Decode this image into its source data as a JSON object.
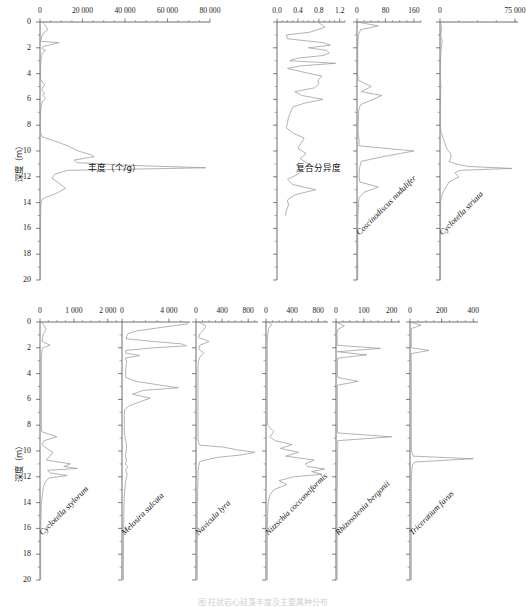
{
  "figure": {
    "width": 526,
    "height": 607,
    "caption": "图  柱状岩心硅藻丰度及主要属种分布",
    "depth_axis": {
      "title": "深度（m）",
      "unit": "m",
      "min": 0,
      "max": 20,
      "ticks": [
        0,
        2,
        4,
        6,
        8,
        10,
        12,
        14,
        16,
        18,
        20
      ],
      "minor_step": 1,
      "direction": "downward"
    },
    "line_color": "#9a9a9a",
    "axis_color": "#4a4a4a",
    "text_color": "#1a1a1a"
  },
  "chart_data": [
    {
      "id": "abundance",
      "row": 1,
      "col": 1,
      "type": "line",
      "title": "丰度（个/g）",
      "title_is_chinese": true,
      "xlabel": "丰度（个/g）",
      "ylabel": "深度（m）",
      "xlim": [
        0,
        80000
      ],
      "xticks": [
        0,
        20000,
        40000,
        60000,
        80000
      ],
      "xtick_labels": [
        "0",
        "20 000",
        "40 000",
        "60 000",
        "80 000"
      ],
      "minor_ticks_per_major": 4,
      "ylim": [
        0,
        20
      ],
      "grid": false,
      "depth": [
        0.0,
        0.3,
        0.6,
        0.9,
        1.2,
        1.5,
        1.6,
        1.75,
        1.9,
        2.05,
        2.2,
        2.4,
        2.6,
        2.8,
        3.0,
        3.3,
        3.6,
        4.0,
        4.4,
        4.7,
        4.9,
        5.1,
        5.3,
        5.5,
        5.7,
        5.9,
        6.1,
        6.4,
        6.7,
        7.0,
        7.4,
        7.8,
        8.2,
        8.6,
        8.9,
        9.2,
        9.6,
        10.0,
        10.3,
        10.45,
        10.7,
        10.9,
        11.1,
        11.3,
        11.5,
        11.65,
        11.8,
        12.1,
        12.5,
        12.9,
        13.3,
        13.6,
        13.8,
        14.2,
        15.0,
        16.0,
        17.0,
        18.0,
        19.0,
        20.0
      ],
      "values": [
        1200,
        2600,
        3700,
        1400,
        700,
        300,
        9000,
        5200,
        1500,
        900,
        2600,
        1100,
        700,
        500,
        420,
        350,
        300,
        260,
        200,
        1200,
        2300,
        1100,
        900,
        2200,
        1400,
        2600,
        1500,
        700,
        420,
        320,
        260,
        220,
        200,
        260,
        900,
        6500,
        13000,
        18000,
        24000,
        25500,
        16000,
        17500,
        40000,
        78000,
        13000,
        10000,
        7000,
        5600,
        9000,
        12000,
        7500,
        2600,
        700,
        420,
        300,
        260,
        220,
        200,
        180,
        160
      ]
    },
    {
      "id": "composite-diversity",
      "row": 1,
      "col": 2,
      "type": "line",
      "title": "复合分异度",
      "title_is_chinese": true,
      "xlabel": "复合分异度",
      "xlim": [
        0,
        1.3
      ],
      "xticks": [
        0.0,
        0.4,
        0.8,
        1.2
      ],
      "xtick_labels": [
        "0.0",
        "0.4",
        "0.8",
        "1.2"
      ],
      "minor_ticks_per_major": 4,
      "ylim": [
        0,
        20
      ],
      "grid": false,
      "depth": [
        0.0,
        0.4,
        0.8,
        1.0,
        1.3,
        1.6,
        1.8,
        2.0,
        2.2,
        2.4,
        2.6,
        2.8,
        3.0,
        3.2,
        3.4,
        3.6,
        3.9,
        4.2,
        4.5,
        4.8,
        5.1,
        5.4,
        5.7,
        6.0,
        6.3,
        6.6,
        7.0,
        7.4,
        7.8,
        8.2,
        8.6,
        9.0,
        9.4,
        9.8,
        10.2,
        10.6,
        11.0,
        11.4,
        11.8,
        12.2,
        12.6,
        13.0,
        13.4,
        13.8,
        14.2,
        14.6,
        15.0
      ],
      "values": [
        0.78,
        0.92,
        0.62,
        0.18,
        0.2,
        0.88,
        1.02,
        0.6,
        0.95,
        1.0,
        0.88,
        0.4,
        0.24,
        1.12,
        0.46,
        0.2,
        0.52,
        0.86,
        0.78,
        0.8,
        0.72,
        0.34,
        0.48,
        0.88,
        0.52,
        0.3,
        0.26,
        0.22,
        0.2,
        0.18,
        0.3,
        0.52,
        0.46,
        0.4,
        0.56,
        0.44,
        0.6,
        0.52,
        0.4,
        0.2,
        0.3,
        0.74,
        0.34,
        0.2,
        0.22,
        0.18,
        0.16
      ]
    },
    {
      "id": "coscinodiscus-nodulifer",
      "row": 1,
      "col": 3,
      "type": "line",
      "title": "Coscinodiscus nodulifer",
      "title_is_chinese": false,
      "xlim": [
        0,
        180
      ],
      "xticks": [
        0,
        80,
        160
      ],
      "xtick_labels": [
        "0",
        "80",
        "160"
      ],
      "minor_ticks_per_major": 4,
      "ylim": [
        0,
        20
      ],
      "grid": false,
      "depth": [
        0.0,
        0.3,
        0.6,
        1.0,
        1.5,
        2.0,
        2.5,
        3.0,
        3.5,
        4.0,
        4.5,
        5.0,
        5.4,
        5.7,
        6.0,
        6.4,
        6.8,
        7.2,
        7.6,
        8.0,
        8.4,
        8.8,
        9.2,
        9.6,
        10.0,
        10.4,
        10.8,
        11.2,
        11.6,
        12.0,
        12.4,
        12.8,
        13.2,
        13.6,
        14.0,
        15.0,
        16.0,
        18.0,
        20.0
      ],
      "values": [
        0,
        60,
        10,
        4,
        3,
        2,
        2,
        2,
        2,
        2,
        3,
        40,
        12,
        70,
        45,
        10,
        5,
        4,
        4,
        3,
        3,
        4,
        6,
        5,
        160,
        80,
        12,
        8,
        6,
        6,
        8,
        60,
        20,
        6,
        4,
        3,
        2,
        2,
        2
      ]
    },
    {
      "id": "cyclotella-striata",
      "row": 1,
      "col": 4,
      "type": "line",
      "title": "Cyclotella striata",
      "title_is_chinese": false,
      "xlim": [
        0,
        78000
      ],
      "xticks": [
        0,
        75000
      ],
      "xtick_labels": [
        "0",
        "75 000"
      ],
      "minor_ticks_per_major": 4,
      "ylim": [
        0,
        20
      ],
      "grid": false,
      "depth": [
        0.0,
        0.5,
        1.0,
        1.5,
        2.0,
        2.5,
        3.0,
        3.5,
        4.0,
        4.5,
        5.0,
        5.5,
        6.0,
        6.5,
        7.0,
        7.5,
        8.0,
        8.5,
        9.0,
        9.4,
        9.8,
        10.2,
        10.5,
        10.8,
        11.0,
        11.2,
        11.35,
        11.5,
        11.7,
        12.0,
        12.4,
        12.8,
        13.2,
        13.6,
        14.0,
        15.0,
        16.0,
        18.0,
        20.0
      ],
      "values": [
        400,
        1800,
        700,
        2200,
        1200,
        800,
        600,
        400,
        300,
        400,
        900,
        600,
        500,
        400,
        300,
        300,
        300,
        900,
        3000,
        5000,
        6500,
        10500,
        11000,
        9000,
        16000,
        28000,
        72000,
        20000,
        15000,
        19000,
        9000,
        6000,
        3000,
        1200,
        700,
        400,
        300,
        200,
        200
      ]
    },
    {
      "id": "cyclotella-stylorum",
      "row": 2,
      "col": 1,
      "type": "line",
      "title": "Cyclotella stylorum",
      "title_is_chinese": false,
      "xlim": [
        0,
        2300
      ],
      "xticks": [
        0,
        1000,
        2000
      ],
      "xtick_labels": [
        "0",
        "1 000",
        "2 000"
      ],
      "minor_ticks_per_major": 4,
      "ylim": [
        0,
        20
      ],
      "grid": false,
      "depth": [
        0.0,
        0.3,
        0.6,
        0.9,
        1.2,
        1.5,
        1.8,
        2.0,
        2.2,
        2.6,
        3.0,
        3.5,
        4.0,
        4.5,
        5.0,
        5.5,
        6.0,
        6.5,
        7.0,
        7.5,
        8.0,
        8.5,
        8.9,
        9.2,
        9.5,
        9.8,
        10.1,
        10.4,
        10.7,
        11.0,
        11.2,
        11.35,
        11.5,
        11.7,
        11.9,
        12.1,
        12.4,
        12.8,
        13.2,
        13.6,
        14.0,
        15.0,
        16.0,
        18.0,
        20.0
      ],
      "values": [
        60,
        130,
        180,
        100,
        80,
        60,
        300,
        80,
        60,
        50,
        40,
        40,
        40,
        40,
        40,
        40,
        40,
        40,
        40,
        40,
        40,
        50,
        500,
        120,
        60,
        200,
        380,
        300,
        180,
        900,
        700,
        1100,
        220,
        300,
        800,
        260,
        160,
        100,
        80,
        60,
        40,
        30,
        20,
        20,
        20
      ]
    },
    {
      "id": "melosira-sulcata",
      "row": 2,
      "col": 2,
      "type": "line",
      "title": "Melosira sulcata",
      "title_is_chinese": false,
      "xlim": [
        0,
        5800
      ],
      "xticks": [
        0,
        4000
      ],
      "xtick_labels": [
        "0",
        "4 000"
      ],
      "minor_ticks_per_major": 4,
      "ylim": [
        0,
        20
      ],
      "grid": false,
      "depth": [
        0.0,
        0.15,
        0.4,
        0.7,
        0.9,
        1.1,
        1.3,
        1.5,
        1.7,
        1.85,
        2.0,
        2.2,
        2.4,
        2.6,
        2.8,
        3.1,
        3.4,
        3.7,
        4.0,
        4.3,
        4.6,
        4.9,
        5.1,
        5.3,
        5.6,
        5.9,
        6.2,
        6.5,
        6.8,
        7.1,
        7.4,
        7.7,
        8.0,
        8.4,
        8.8,
        9.2,
        9.6,
        10.0,
        10.4,
        10.8,
        11.0,
        11.2,
        11.5,
        11.8,
        12.1,
        12.4,
        12.8,
        13.2,
        13.6,
        14.0,
        15.0,
        16.0,
        18.0,
        20.0
      ],
      "values": [
        5500,
        5600,
        3500,
        1200,
        500,
        400,
        350,
        2600,
        5100,
        5500,
        2700,
        320,
        300,
        1500,
        280,
        400,
        350,
        320,
        300,
        320,
        1200,
        3300,
        4800,
        1800,
        900,
        2400,
        1500,
        600,
        220,
        200,
        200,
        200,
        200,
        200,
        220,
        320,
        400,
        350,
        300,
        380,
        260,
        500,
        300,
        450,
        350,
        300,
        260,
        220,
        200,
        180,
        150,
        140,
        120,
        120
      ]
    },
    {
      "id": "navicula-lyra",
      "row": 2,
      "col": 3,
      "type": "line",
      "title": "Navicula lyra",
      "title_is_chinese": false,
      "xlim": [
        0,
        950
      ],
      "xticks": [
        0,
        400,
        800
      ],
      "xtick_labels": [
        "0",
        "400",
        "800"
      ],
      "minor_ticks_per_major": 4,
      "ylim": [
        0,
        20
      ],
      "grid": false,
      "depth": [
        0.0,
        0.3,
        0.6,
        0.9,
        1.2,
        1.5,
        1.8,
        2.1,
        2.4,
        2.7,
        3.0,
        3.5,
        4.0,
        4.5,
        5.0,
        5.5,
        6.0,
        6.5,
        7.0,
        7.5,
        8.0,
        8.5,
        9.0,
        9.4,
        9.55,
        9.7,
        9.9,
        10.1,
        10.3,
        10.5,
        10.8,
        11.2,
        11.6,
        12.0,
        12.5,
        13.0,
        13.5,
        14.0,
        15.0,
        16.0,
        18.0,
        20.0
      ],
      "values": [
        40,
        150,
        120,
        60,
        40,
        200,
        60,
        40,
        120,
        60,
        40,
        30,
        30,
        30,
        30,
        30,
        30,
        30,
        30,
        30,
        30,
        30,
        30,
        40,
        60,
        420,
        620,
        900,
        700,
        320,
        60,
        40,
        30,
        30,
        30,
        25,
        25,
        20,
        20,
        20,
        20,
        20
      ]
    },
    {
      "id": "nitzschia-cocconeiformis",
      "row": 2,
      "col": 4,
      "type": "line",
      "title": "Nitzschia cocconeiformis",
      "title_is_chinese": false,
      "xlim": [
        0,
        950
      ],
      "xticks": [
        0,
        400,
        800
      ],
      "xtick_labels": [
        "0",
        "400",
        "800"
      ],
      "minor_ticks_per_major": 4,
      "ylim": [
        0,
        20
      ],
      "grid": false,
      "depth": [
        0.0,
        0.2,
        0.5,
        1.0,
        1.5,
        2.0,
        2.5,
        3.0,
        3.5,
        4.0,
        4.5,
        5.0,
        5.5,
        6.0,
        6.5,
        7.0,
        7.5,
        8.0,
        8.5,
        8.9,
        9.2,
        9.5,
        9.8,
        10.1,
        10.4,
        10.7,
        11.0,
        11.2,
        11.4,
        11.6,
        11.8,
        12.0,
        12.3,
        12.6,
        13.0,
        13.4,
        13.8,
        14.2,
        15.0,
        16.0,
        18.0,
        20.0
      ],
      "values": [
        30,
        90,
        40,
        25,
        20,
        20,
        20,
        20,
        20,
        20,
        20,
        20,
        20,
        20,
        20,
        20,
        20,
        25,
        120,
        60,
        140,
        400,
        220,
        500,
        300,
        740,
        600,
        640,
        900,
        700,
        860,
        420,
        200,
        320,
        120,
        60,
        40,
        30,
        25,
        20,
        20,
        20
      ]
    },
    {
      "id": "rhizosolenia-bergonii",
      "row": 2,
      "col": 5,
      "type": "line",
      "title": "Rhizosolenia bergonii",
      "title_is_chinese": false,
      "xlim": [
        0,
        230
      ],
      "xticks": [
        0,
        100,
        200
      ],
      "xtick_labels": [
        "0",
        "100",
        "200"
      ],
      "minor_ticks_per_major": 4,
      "ylim": [
        0,
        20
      ],
      "grid": false,
      "depth": [
        0.0,
        0.3,
        0.6,
        1.0,
        1.4,
        1.8,
        2.05,
        2.3,
        2.55,
        2.8,
        3.1,
        3.4,
        3.7,
        4.0,
        4.3,
        4.6,
        4.9,
        5.2,
        5.5,
        5.8,
        6.2,
        6.6,
        7.0,
        7.4,
        7.8,
        8.2,
        8.6,
        8.9,
        9.2,
        9.5,
        9.9,
        10.3,
        10.7,
        11.1,
        11.5,
        12.0,
        12.5,
        13.0,
        13.5,
        14.0,
        15.0,
        16.0,
        18.0,
        20.0
      ],
      "values": [
        0,
        30,
        5,
        4,
        4,
        4,
        160,
        5,
        110,
        6,
        5,
        5,
        5,
        5,
        6,
        80,
        5,
        5,
        5,
        5,
        5,
        5,
        5,
        5,
        5,
        5,
        6,
        200,
        6,
        6,
        6,
        6,
        6,
        6,
        5,
        5,
        5,
        4,
        4,
        4,
        4,
        4,
        4,
        4
      ]
    },
    {
      "id": "triceratium-favus",
      "row": 2,
      "col": 6,
      "type": "line",
      "title": "Triceratium favus",
      "title_is_chinese": false,
      "xlim": [
        0,
        430
      ],
      "xticks": [
        0,
        200,
        400
      ],
      "xtick_labels": [
        "0",
        "200",
        "400"
      ],
      "minor_ticks_per_major": 4,
      "ylim": [
        0,
        20
      ],
      "grid": false,
      "depth": [
        0.0,
        0.25,
        0.5,
        0.8,
        1.1,
        1.4,
        1.7,
        2.0,
        2.2,
        2.45,
        2.7,
        3.0,
        3.4,
        3.8,
        4.2,
        4.6,
        5.0,
        5.5,
        6.0,
        6.5,
        7.0,
        7.5,
        8.0,
        8.5,
        9.0,
        9.5,
        10.0,
        10.4,
        10.6,
        10.85,
        11.1,
        11.4,
        11.8,
        12.2,
        12.6,
        13.0,
        13.5,
        14.0,
        15.0,
        16.0,
        18.0,
        20.0
      ],
      "values": [
        0,
        70,
        10,
        8,
        8,
        8,
        8,
        8,
        120,
        8,
        8,
        8,
        8,
        8,
        8,
        8,
        8,
        8,
        8,
        8,
        8,
        8,
        8,
        8,
        8,
        8,
        10,
        20,
        400,
        30,
        15,
        12,
        10,
        10,
        8,
        8,
        8,
        8,
        8,
        8,
        8,
        8
      ]
    }
  ]
}
